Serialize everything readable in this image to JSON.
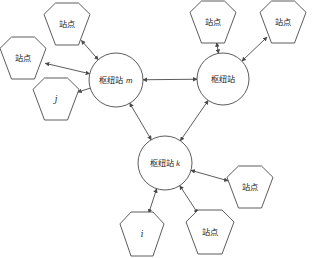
{
  "diagram": {
    "type": "node-link-network",
    "canvas": {
      "width": 313,
      "height": 258
    },
    "colors": {
      "background": "#ffffff",
      "stroke": "#4a4a4a",
      "text": "#1a1a1a",
      "fill": "#ffffff"
    },
    "nodes": [
      {
        "id": "hub-m",
        "shape": "circle",
        "label": "枢纽站",
        "subscript": "m",
        "cx": 116,
        "cy": 80,
        "r": 27
      },
      {
        "id": "hub-right",
        "shape": "circle",
        "label": "枢纽站",
        "subscript": "",
        "cx": 223,
        "cy": 79,
        "r": 26
      },
      {
        "id": "hub-k",
        "shape": "circle",
        "label": "枢纽站",
        "subscript": "k",
        "cx": 165,
        "cy": 163,
        "r": 27
      },
      {
        "id": "station-top-left",
        "shape": "hexagon",
        "label": "站点",
        "italic": false,
        "cx": 67,
        "cy": 24,
        "rx": 23,
        "ry": 21
      },
      {
        "id": "station-left",
        "shape": "hexagon",
        "label": "站点",
        "italic": false,
        "cx": 23,
        "cy": 58,
        "rx": 23,
        "ry": 21
      },
      {
        "id": "station-j",
        "shape": "hexagon",
        "label": "j",
        "italic": true,
        "cx": 56,
        "cy": 99,
        "rx": 23,
        "ry": 21
      },
      {
        "id": "station-top-mid",
        "shape": "hexagon",
        "label": "站点",
        "italic": false,
        "cx": 213,
        "cy": 22,
        "rx": 23,
        "ry": 21
      },
      {
        "id": "station-top-right",
        "shape": "hexagon",
        "label": "站点",
        "italic": false,
        "cx": 283,
        "cy": 22,
        "rx": 23,
        "ry": 21
      },
      {
        "id": "station-right-lower",
        "shape": "hexagon",
        "label": "站点",
        "italic": false,
        "cx": 250,
        "cy": 187,
        "rx": 23,
        "ry": 21
      },
      {
        "id": "station-i",
        "shape": "hexagon",
        "label": "i",
        "italic": true,
        "cx": 142,
        "cy": 234,
        "rx": 22,
        "ry": 22
      },
      {
        "id": "station-bottom",
        "shape": "hexagon",
        "label": "站点",
        "italic": false,
        "cx": 210,
        "cy": 232,
        "rx": 24,
        "ry": 22
      }
    ],
    "edges": [
      {
        "id": "edge-hubm-hubright",
        "from": "hub-m",
        "to": "hub-right",
        "arrows": "both"
      },
      {
        "id": "edge-hubm-hubk",
        "from": "hub-m",
        "to": "hub-k",
        "arrows": "both"
      },
      {
        "id": "edge-hubright-hubk",
        "from": "hub-right",
        "to": "hub-k",
        "arrows": "both"
      },
      {
        "id": "edge-hubm-station-top-left",
        "from": "hub-m",
        "to": "station-top-left",
        "arrows": "both"
      },
      {
        "id": "edge-hubm-station-left",
        "from": "hub-m",
        "to": "station-left",
        "arrows": "both"
      },
      {
        "id": "edge-hubm-station-j",
        "from": "hub-m",
        "to": "station-j",
        "arrows": "to"
      },
      {
        "id": "edge-hubright-station-top-mid",
        "from": "hub-right",
        "to": "station-top-mid",
        "arrows": "both"
      },
      {
        "id": "edge-hubright-station-top-right",
        "from": "hub-right",
        "to": "station-top-right",
        "arrows": "both"
      },
      {
        "id": "edge-hubk-station-right-lower",
        "from": "hub-k",
        "to": "station-right-lower",
        "arrows": "both"
      },
      {
        "id": "edge-hubk-station-i",
        "from": "hub-k",
        "to": "station-i",
        "arrows": "both"
      },
      {
        "id": "edge-hubk-station-bottom",
        "from": "hub-k",
        "to": "station-bottom",
        "arrows": "both"
      }
    ]
  }
}
